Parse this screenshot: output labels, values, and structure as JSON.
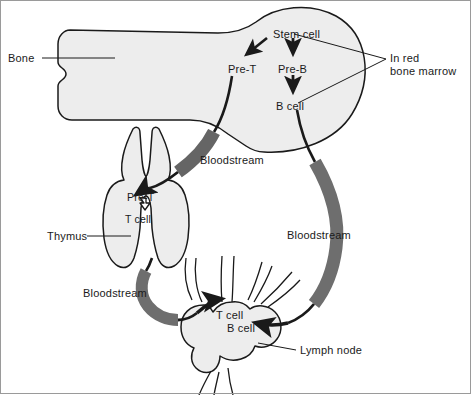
{
  "diagram": {
    "colors": {
      "organ_fill": "#ededed",
      "organ_fill_light": "#f2f2f2",
      "organ_outline": "#1a1a1a",
      "vessel_gray": "#6e6e6e",
      "vessel_dark": "#1a1a1a",
      "text": "#1a1a1a",
      "leader_line": "#1a1a1a",
      "background": "#ffffff"
    },
    "external_labels": [
      {
        "id": "bone",
        "text": "Bone",
        "x": 8,
        "y": 52
      },
      {
        "id": "marrow",
        "text": "In red\nbone marrow",
        "x": 390,
        "y": 52
      },
      {
        "id": "thymus",
        "text": "Thymus",
        "x": 47,
        "y": 230
      },
      {
        "id": "lymph-node",
        "text": "Lymph node",
        "x": 300,
        "y": 344
      }
    ],
    "bloodstream_labels": [
      {
        "id": "bloodstream-upper",
        "text": "Bloodstream",
        "x": 200,
        "y": 154
      },
      {
        "id": "bloodstream-right",
        "text": "Bloodstream",
        "x": 287,
        "y": 229
      },
      {
        "id": "bloodstream-lower",
        "text": "Bloodstream",
        "x": 83,
        "y": 287
      }
    ],
    "cell_labels": [
      {
        "id": "stem-cell",
        "text": "Stem cell",
        "x": 273,
        "y": 28,
        "region": "bone-marrow"
      },
      {
        "id": "pre-t-bone",
        "text": "Pre-T",
        "x": 228,
        "y": 63,
        "region": "bone-marrow"
      },
      {
        "id": "pre-b",
        "text": "Pre-B",
        "x": 278,
        "y": 63,
        "region": "bone-marrow"
      },
      {
        "id": "b-cell-bone",
        "text": "B cell",
        "x": 276,
        "y": 100,
        "region": "bone-marrow"
      },
      {
        "id": "pre-t-thymus",
        "text": "Pre-T",
        "x": 127,
        "y": 191,
        "region": "thymus"
      },
      {
        "id": "t-cell-thymus",
        "text": "T cell",
        "x": 125,
        "y": 213,
        "region": "thymus"
      },
      {
        "id": "t-cell-node",
        "text": "T cell",
        "x": 216,
        "y": 309,
        "region": "lymph-node"
      },
      {
        "id": "b-cell-node",
        "text": "B cell",
        "x": 227,
        "y": 322,
        "region": "lymph-node"
      }
    ],
    "organs": [
      {
        "id": "bone",
        "name": "long bone with marrow cavity"
      },
      {
        "id": "thymus",
        "name": "bilobed thymus"
      },
      {
        "id": "lymph-node",
        "name": "lymph node with afferent and efferent vessels"
      }
    ],
    "vessels": [
      {
        "id": "vessel-bone-to-thymus",
        "from": "Pre-T",
        "to": "thymus"
      },
      {
        "id": "vessel-bone-to-lymphnode",
        "from": "B cell",
        "to": "lymph node"
      },
      {
        "id": "vessel-thymus-to-lymphnode",
        "from": "thymus",
        "to": "lymph node"
      }
    ]
  }
}
